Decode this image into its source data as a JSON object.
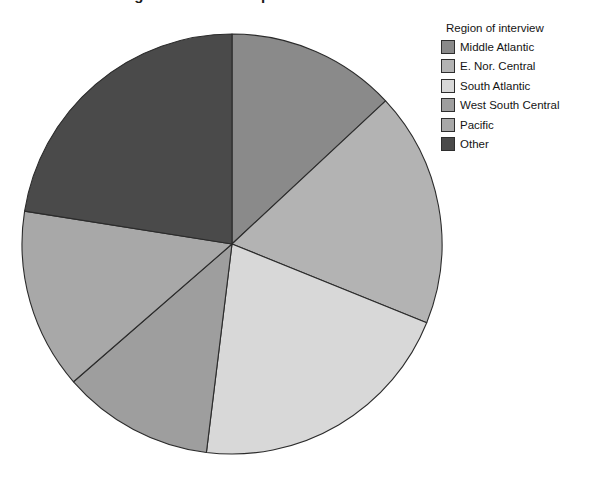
{
  "chart_data": {
    "type": "pie",
    "title": "Region of interview pie chart",
    "title_clipped": true,
    "legend_title": "Region of interview",
    "legend_position": "right",
    "categories": [
      "Middle Atlantic",
      "E. Nor. Central",
      "South Atlantic",
      "West South Central",
      "Pacific",
      "Other"
    ],
    "values": [
      13.1,
      18.1,
      20.8,
      11.7,
      13.9,
      22.5
    ],
    "units": "percent",
    "start_angle_deg": 0,
    "direction": "clockwise",
    "slices": [
      {
        "label": "Middle Atlantic",
        "value": 13.1,
        "start_deg": 0,
        "end_deg": 47,
        "color": "#8a8a8a"
      },
      {
        "label": "E. Nor. Central",
        "value": 18.1,
        "start_deg": 47,
        "end_deg": 112,
        "color": "#b3b3b3"
      },
      {
        "label": "South Atlantic",
        "value": 20.8,
        "start_deg": 112,
        "end_deg": 187,
        "color": "#d8d8d8"
      },
      {
        "label": "West South Central",
        "value": 11.7,
        "start_deg": 187,
        "end_deg": 229,
        "color": "#9e9e9e"
      },
      {
        "label": "Pacific",
        "value": 13.9,
        "start_deg": 229,
        "end_deg": 279,
        "color": "#a8a8a8"
      },
      {
        "label": "Other",
        "value": 22.5,
        "start_deg": 279,
        "end_deg": 360,
        "color": "#4a4a4a"
      }
    ],
    "geometry": {
      "cx": 211,
      "cy": 211,
      "r": 210
    },
    "xlabel": "",
    "ylabel": "",
    "grid": false
  },
  "colors": {
    "background": "#ffffff",
    "outline": "#2b2b2b",
    "text": "#141414"
  }
}
